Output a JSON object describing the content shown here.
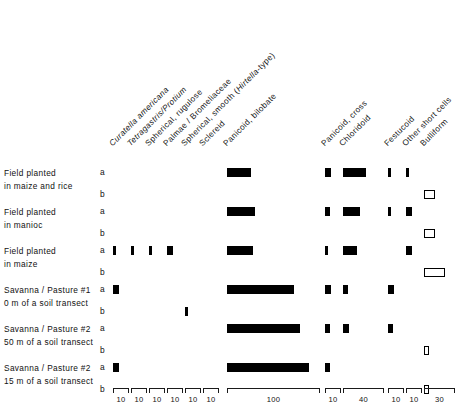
{
  "figure": {
    "kind": "phytolith-abundance-diagram",
    "bar_color": "#000000",
    "open_bar_color": "#ffffff",
    "axis_color": "#1a1a1a"
  },
  "chart_data": {
    "type": "bar",
    "title": "",
    "xlabel": "",
    "ylabel": "",
    "grid": false,
    "legend": "none",
    "orientation": "horizontal",
    "columns": [
      {
        "key": "curatella_americana",
        "label": "Curatella americana",
        "italic": true,
        "scale_max": 10,
        "group": 1
      },
      {
        "key": "tetragastris_protium",
        "label": "Tetragastris/Protium",
        "italic": true,
        "scale_max": 10,
        "group": 1
      },
      {
        "key": "spherical_rugulose",
        "label": "Spherical, rugulose",
        "italic": false,
        "scale_max": 10,
        "group": 1
      },
      {
        "key": "palmae_bromeliaceae",
        "label": "Palmae / Bromeliaceae",
        "italic": false,
        "scale_max": 10,
        "group": 1
      },
      {
        "key": "spherical_smooth",
        "label": "Spherical, smooth (Hirtella-type)",
        "italic": false,
        "italic_part": "Hirtella",
        "scale_max": 10,
        "group": 1
      },
      {
        "key": "sclereid",
        "label": "Sclereid",
        "italic": false,
        "scale_max": 10,
        "group": 1
      },
      {
        "key": "panicoid_bilobate",
        "label": "Panicoid, bilobate",
        "italic": false,
        "scale_max": 100,
        "group": 2
      },
      {
        "key": "panicoid_cross",
        "label": "Panicoid, cross",
        "italic": false,
        "scale_max": 10,
        "group": 3
      },
      {
        "key": "chloridoid",
        "label": "Chloridoid",
        "italic": false,
        "scale_max": 40,
        "group": 3
      },
      {
        "key": "festucoid",
        "label": "Festucoid",
        "italic": false,
        "scale_max": 10,
        "group": 4
      },
      {
        "key": "other_short_cells",
        "label": "Other short cells",
        "italic": false,
        "scale_max": 10,
        "group": 4
      },
      {
        "key": "bulliform",
        "label": "Bulliform",
        "italic": false,
        "scale_max": 30,
        "group": 4
      }
    ],
    "axis_tick_labels": [
      "10",
      "10",
      "10",
      "10",
      "10",
      "10",
      "100",
      "10",
      "40",
      "10",
      "10",
      "30"
    ],
    "samples": [
      {
        "label_line1": "Field planted",
        "label_line2": "in maize and rice",
        "sub_a": "a",
        "sub_b": "b",
        "series_a": {
          "curatella_americana": 0,
          "tetragastris_protium": 0,
          "spherical_rugulose": 0,
          "palmae_bromeliaceae": 0,
          "spherical_smooth": 0,
          "sclereid": 0,
          "panicoid_bilobate": 26,
          "panicoid_cross": 4,
          "chloridoid": 22,
          "festucoid": 2,
          "other_short_cells": 2,
          "bulliform": 0
        },
        "series_b": {
          "curatella_americana": 0,
          "tetragastris_protium": 0,
          "spherical_rugulose": 0,
          "palmae_bromeliaceae": 0,
          "spherical_smooth": 0,
          "sclereid": 0,
          "panicoid_bilobate": 0,
          "panicoid_cross": 0,
          "chloridoid": 0,
          "festucoid": 0,
          "other_short_cells": 0,
          "bulliform": 11
        }
      },
      {
        "label_line1": "Field planted",
        "label_line2": "in manioc",
        "sub_a": "a",
        "sub_b": "b",
        "series_a": {
          "curatella_americana": 0,
          "tetragastris_protium": 0,
          "spherical_rugulose": 0,
          "palmae_bromeliaceae": 0,
          "spherical_smooth": 0,
          "sclereid": 0,
          "panicoid_bilobate": 30,
          "panicoid_cross": 3,
          "chloridoid": 17,
          "festucoid": 2,
          "other_short_cells": 4,
          "bulliform": 0
        },
        "series_b": {
          "curatella_americana": 0,
          "tetragastris_protium": 0,
          "spherical_rugulose": 0,
          "palmae_bromeliaceae": 0,
          "spherical_smooth": 0,
          "sclereid": 0,
          "panicoid_bilobate": 0,
          "panicoid_cross": 0,
          "chloridoid": 0,
          "festucoid": 0,
          "other_short_cells": 0,
          "bulliform": 11
        }
      },
      {
        "label_line1": "Field planted",
        "label_line2": "in maize",
        "sub_a": "a",
        "sub_b": "b",
        "series_a": {
          "curatella_americana": 2,
          "tetragastris_protium": 2,
          "spherical_rugulose": 2,
          "palmae_bromeliaceae": 4,
          "spherical_smooth": 0,
          "sclereid": 0,
          "panicoid_bilobate": 28,
          "panicoid_cross": 2,
          "chloridoid": 14,
          "festucoid": 0,
          "other_short_cells": 4,
          "bulliform": 0
        },
        "series_b": {
          "curatella_americana": 0,
          "tetragastris_protium": 0,
          "spherical_rugulose": 0,
          "palmae_bromeliaceae": 0,
          "spherical_smooth": 0,
          "sclereid": 0,
          "panicoid_bilobate": 0,
          "panicoid_cross": 0,
          "chloridoid": 0,
          "festucoid": 0,
          "other_short_cells": 0,
          "bulliform": 20
        }
      },
      {
        "label_line1": "Savanna / Pasture #1",
        "label_line2": "0 m of a soil transect",
        "sub_a": "a",
        "sub_b": "b",
        "series_a": {
          "curatella_americana": 4,
          "tetragastris_protium": 0,
          "spherical_rugulose": 0,
          "palmae_bromeliaceae": 0,
          "spherical_smooth": 0,
          "sclereid": 0,
          "panicoid_bilobate": 72,
          "panicoid_cross": 4,
          "chloridoid": 5,
          "festucoid": 4,
          "other_short_cells": 0,
          "bulliform": 0
        },
        "series_b": {
          "curatella_americana": 0,
          "tetragastris_protium": 0,
          "spherical_rugulose": 0,
          "palmae_bromeliaceae": 0,
          "spherical_smooth": 2,
          "sclereid": 0,
          "panicoid_bilobate": 0,
          "panicoid_cross": 0,
          "chloridoid": 0,
          "festucoid": 0,
          "other_short_cells": 0,
          "bulliform": 0
        }
      },
      {
        "label_line1": "Savanna / Pasture #2",
        "label_line2": "50 m of a soil transect",
        "sub_a": "a",
        "sub_b": "b",
        "series_a": {
          "curatella_americana": 0,
          "tetragastris_protium": 0,
          "spherical_rugulose": 0,
          "palmae_bromeliaceae": 0,
          "spherical_smooth": 0,
          "sclereid": 0,
          "panicoid_bilobate": 78,
          "panicoid_cross": 3,
          "chloridoid": 6,
          "festucoid": 3,
          "other_short_cells": 0,
          "bulliform": 0
        },
        "series_b": {
          "curatella_americana": 0,
          "tetragastris_protium": 0,
          "spherical_rugulose": 0,
          "palmae_bromeliaceae": 0,
          "spherical_smooth": 0,
          "sclereid": 0,
          "panicoid_bilobate": 0,
          "panicoid_cross": 0,
          "chloridoid": 0,
          "festucoid": 0,
          "other_short_cells": 0,
          "bulliform": 5
        }
      },
      {
        "label_line1": "Savanna / Pasture #2",
        "label_line2": "15 m of a soil transect",
        "sub_a": "a",
        "sub_b": "b",
        "series_a": {
          "curatella_americana": 4,
          "tetragastris_protium": 0,
          "spherical_rugulose": 0,
          "palmae_bromeliaceae": 0,
          "spherical_smooth": 0,
          "sclereid": 0,
          "panicoid_bilobate": 88,
          "panicoid_cross": 3,
          "chloridoid": 0,
          "festucoid": 0,
          "other_short_cells": 0,
          "bulliform": 0
        },
        "series_b": {
          "curatella_americana": 0,
          "tetragastris_protium": 0,
          "spherical_rugulose": 0,
          "palmae_bromeliaceae": 0,
          "spherical_smooth": 0,
          "sclereid": 0,
          "panicoid_bilobate": 0,
          "panicoid_cross": 0,
          "chloridoid": 0,
          "festucoid": 0,
          "other_short_cells": 0,
          "bulliform": 5
        }
      }
    ]
  }
}
